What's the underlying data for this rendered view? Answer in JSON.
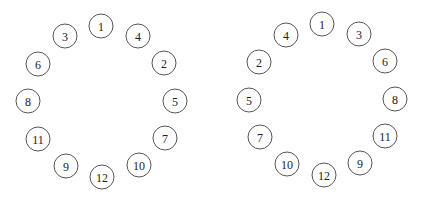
{
  "style": {
    "stroke": "#555555",
    "text": "#222222",
    "radius": 12
  },
  "diagrams": [
    {
      "name": "left-ring",
      "nodes": [
        {
          "label": "1",
          "x": 101,
          "y": 26
        },
        {
          "label": "3",
          "x": 65,
          "y": 36
        },
        {
          "label": "4",
          "x": 138,
          "y": 36
        },
        {
          "label": "6",
          "x": 38,
          "y": 64
        },
        {
          "label": "2",
          "x": 164,
          "y": 63
        },
        {
          "label": "8",
          "x": 28,
          "y": 101
        },
        {
          "label": "5",
          "x": 175,
          "y": 101
        },
        {
          "label": "11",
          "x": 38,
          "y": 139
        },
        {
          "label": "7",
          "x": 165,
          "y": 138
        },
        {
          "label": "9",
          "x": 66,
          "y": 166
        },
        {
          "label": "10",
          "x": 139,
          "y": 165
        },
        {
          "label": "12",
          "x": 102,
          "y": 177
        }
      ]
    },
    {
      "name": "right-ring",
      "nodes": [
        {
          "label": "1",
          "x": 322,
          "y": 24
        },
        {
          "label": "4",
          "x": 286,
          "y": 35
        },
        {
          "label": "3",
          "x": 359,
          "y": 34
        },
        {
          "label": "2",
          "x": 259,
          "y": 62
        },
        {
          "label": "6",
          "x": 385,
          "y": 61
        },
        {
          "label": "5",
          "x": 249,
          "y": 100
        },
        {
          "label": "8",
          "x": 395,
          "y": 99
        },
        {
          "label": "7",
          "x": 260,
          "y": 137
        },
        {
          "label": "11",
          "x": 385,
          "y": 136
        },
        {
          "label": "10",
          "x": 287,
          "y": 164
        },
        {
          "label": "9",
          "x": 360,
          "y": 163
        },
        {
          "label": "12",
          "x": 324,
          "y": 175
        }
      ]
    }
  ]
}
